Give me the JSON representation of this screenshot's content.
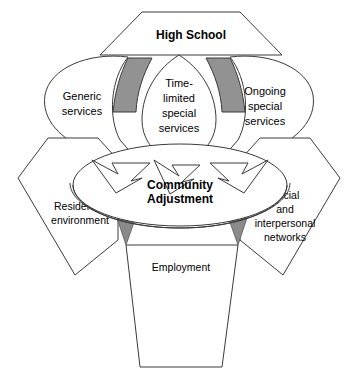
{
  "figure": {
    "background_color": "#ffffff",
    "outline_color": "#3a3a3a",
    "shade_color": "#929292"
  },
  "top": {
    "label": "High School"
  },
  "petals": [
    {
      "id": "generic",
      "line1": "Generic",
      "line2": "services"
    },
    {
      "id": "time-limited",
      "line1": "Time-",
      "line2": "limited",
      "line3": "special",
      "line4": "services"
    },
    {
      "id": "ongoing",
      "line1": "Ongoing",
      "line2": "special",
      "line3": "services"
    }
  ],
  "hub": {
    "line1": "Community",
    "line2": "Adjustment"
  },
  "outcomes": [
    {
      "id": "residential",
      "line1": "Residential",
      "line2": "environment"
    },
    {
      "id": "social",
      "line1": "Social",
      "line2": "and",
      "line3": "interpersonal",
      "line4": "networks"
    },
    {
      "id": "employment",
      "line1": "Employment"
    }
  ]
}
